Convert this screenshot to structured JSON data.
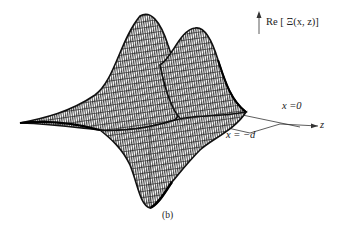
{
  "figure": {
    "panel_label": "(b)",
    "vertical_axis_label": "Re [ Ξ(x, z)]",
    "horizontal_axis_label": "z",
    "boundary_labels": {
      "x0": "x =0",
      "xd": "x = −d"
    },
    "surface": {
      "description": "3D wireframe mesh surface showing two Gaussian-like peaks and a trough along z",
      "line_color": "#1a1a1a",
      "background": "#ffffff"
    }
  }
}
